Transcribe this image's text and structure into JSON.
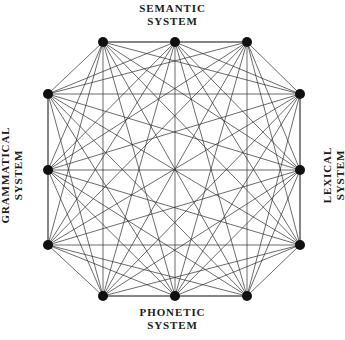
{
  "figure": {
    "background_color": "#ffffff",
    "line_color": "#2b2b2b",
    "node_color": "#101010",
    "labels": {
      "top": "SEMANTIC\nSYSTEM",
      "bottom": "PHONETIC\nSYSTEM",
      "left": "GRAMMATICAL\nSYSTEM",
      "right": "LEXICAL\nSYSTEM"
    }
  },
  "chart_data": {
    "type": "diagram",
    "subtype": "complete-graph",
    "node_count": 12,
    "edge_count": 66,
    "fully_connected": true,
    "node_radius_px": 5,
    "nodes": [
      {
        "id": 0,
        "label": "",
        "group": "top",
        "x": 103,
        "y": 42
      },
      {
        "id": 1,
        "label": "",
        "group": "top",
        "x": 175,
        "y": 42
      },
      {
        "id": 2,
        "label": "",
        "group": "top",
        "x": 247,
        "y": 42
      },
      {
        "id": 3,
        "label": "",
        "group": "right",
        "x": 300,
        "y": 94
      },
      {
        "id": 4,
        "label": "",
        "group": "right",
        "x": 300,
        "y": 170
      },
      {
        "id": 5,
        "label": "",
        "group": "right",
        "x": 300,
        "y": 245
      },
      {
        "id": 6,
        "label": "",
        "group": "bottom",
        "x": 247,
        "y": 296
      },
      {
        "id": 7,
        "label": "",
        "group": "bottom",
        "x": 175,
        "y": 296
      },
      {
        "id": 8,
        "label": "",
        "group": "bottom",
        "x": 103,
        "y": 296
      },
      {
        "id": 9,
        "label": "",
        "group": "left",
        "x": 48,
        "y": 245
      },
      {
        "id": 10,
        "label": "",
        "group": "left",
        "x": 48,
        "y": 170
      },
      {
        "id": 11,
        "label": "",
        "group": "left",
        "x": 48,
        "y": 94
      }
    ],
    "groups": [
      {
        "name": "SEMANTIC SYSTEM",
        "side": "top",
        "node_ids": [
          0,
          1,
          2
        ]
      },
      {
        "name": "LEXICAL SYSTEM",
        "side": "right",
        "node_ids": [
          3,
          4,
          5
        ]
      },
      {
        "name": "PHONETIC SYSTEM",
        "side": "bottom",
        "node_ids": [
          6,
          7,
          8
        ]
      },
      {
        "name": "GRAMMATICAL SYSTEM",
        "side": "left",
        "node_ids": [
          9,
          10,
          11
        ]
      }
    ],
    "annotations": [],
    "xlabel": "",
    "ylabel": "",
    "grid": false,
    "legend": "none"
  }
}
